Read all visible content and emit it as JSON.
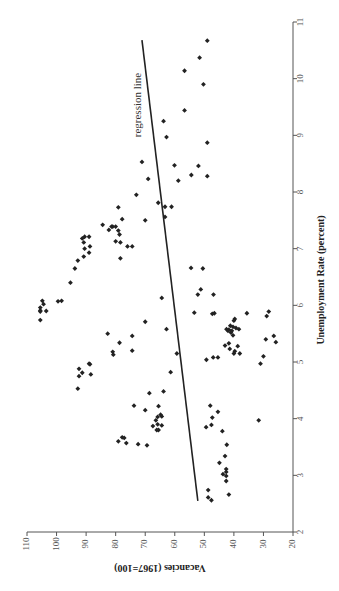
{
  "chart_data": {
    "type": "scatter",
    "orientation": "rotated-90-clockwise",
    "title": "",
    "xlabel": "Unemployment Rate (percent)",
    "ylabel": "Vacancies (1967=100)",
    "xlim": [
      2,
      11
    ],
    "ylim": [
      20,
      110
    ],
    "x_ticks": [
      2,
      3,
      4,
      5,
      6,
      7,
      8,
      9,
      10,
      11
    ],
    "y_ticks": [
      20,
      30,
      40,
      50,
      60,
      70,
      80,
      90,
      100,
      110
    ],
    "grid": false,
    "legend": null,
    "annotations": [
      {
        "text": "regression line",
        "x": 9.3,
        "y": 74
      }
    ],
    "regression_line": {
      "x": [
        2.55,
        10.68
      ],
      "y": [
        52.2,
        71.1
      ]
    },
    "series": [
      {
        "name": "observations",
        "points": [
          [
            10.67,
            49.0
          ],
          [
            10.37,
            51.6
          ],
          [
            10.14,
            56.7
          ],
          [
            9.9,
            50.3
          ],
          [
            9.44,
            56.7
          ],
          [
            8.87,
            49.0
          ],
          [
            8.46,
            52.0
          ],
          [
            8.3,
            54.4
          ],
          [
            8.28,
            49.0
          ],
          [
            9.25,
            63.8
          ],
          [
            8.97,
            62.8
          ],
          [
            8.47,
            60.1
          ],
          [
            8.2,
            58.8
          ],
          [
            8.53,
            71.1
          ],
          [
            8.23,
            69.0
          ],
          [
            7.95,
            73.0
          ],
          [
            7.73,
            79.1
          ],
          [
            7.52,
            77.8
          ],
          [
            7.81,
            65.6
          ],
          [
            7.74,
            63.3
          ],
          [
            7.74,
            61.1
          ],
          [
            7.56,
            63.3
          ],
          [
            7.5,
            70.0
          ],
          [
            7.39,
            80.0
          ],
          [
            7.39,
            81.0
          ],
          [
            7.39,
            81.4
          ],
          [
            7.32,
            79.1
          ],
          [
            7.25,
            78.7
          ],
          [
            7.04,
            74.4
          ],
          [
            6.83,
            78.4
          ],
          [
            7.42,
            84.4
          ],
          [
            7.33,
            82.3
          ],
          [
            7.13,
            80.0
          ],
          [
            7.11,
            78.4
          ],
          [
            7.04,
            76.0
          ],
          [
            7.21,
            90.5
          ],
          [
            7.21,
            89.0
          ],
          [
            7.18,
            91.3
          ],
          [
            7.11,
            90.8
          ],
          [
            7.04,
            88.7
          ],
          [
            7.0,
            90.5
          ],
          [
            6.93,
            89.0
          ],
          [
            6.86,
            90.8
          ],
          [
            6.79,
            92.8
          ],
          [
            6.65,
            93.8
          ],
          [
            6.4,
            95.3
          ],
          [
            6.07,
            99.5
          ],
          [
            6.08,
            98.3
          ],
          [
            6.08,
            104.8
          ],
          [
            6.02,
            104.4
          ],
          [
            5.96,
            105.5
          ],
          [
            5.91,
            105.5
          ],
          [
            5.9,
            103.5
          ],
          [
            5.89,
            105.5
          ],
          [
            5.74,
            105.5
          ],
          [
            6.66,
            54.5
          ],
          [
            6.65,
            50.5
          ],
          [
            6.13,
            64.4
          ],
          [
            6.28,
            51.2
          ],
          [
            6.19,
            52.2
          ],
          [
            6.19,
            46.9
          ],
          [
            5.86,
            46.6
          ],
          [
            5.85,
            47.3
          ],
          [
            5.87,
            53.4
          ],
          [
            5.58,
            62.8
          ],
          [
            5.89,
            28.2
          ],
          [
            5.81,
            28.9
          ],
          [
            5.86,
            35.6
          ],
          [
            5.76,
            39.7
          ],
          [
            5.73,
            40.0
          ],
          [
            5.64,
            41.2
          ],
          [
            5.58,
            42.5
          ],
          [
            5.62,
            40.3
          ],
          [
            5.6,
            39.3
          ],
          [
            5.57,
            41.7
          ],
          [
            5.55,
            40.7
          ],
          [
            5.58,
            38.3
          ],
          [
            5.55,
            42.0
          ],
          [
            5.52,
            41.0
          ],
          [
            5.47,
            40.3
          ],
          [
            5.29,
            43.0
          ],
          [
            5.33,
            41.7
          ],
          [
            5.28,
            38.7
          ],
          [
            5.23,
            41.4
          ],
          [
            5.19,
            39.7
          ],
          [
            5.15,
            40.0
          ],
          [
            5.15,
            38.0
          ],
          [
            5.08,
            45.4
          ],
          [
            5.08,
            47.0
          ],
          [
            5.04,
            49.3
          ],
          [
            5.4,
            29.2
          ],
          [
            5.46,
            26.5
          ],
          [
            5.35,
            25.8
          ],
          [
            5.1,
            30.0
          ],
          [
            4.97,
            31.0
          ],
          [
            5.15,
            59.3
          ],
          [
            4.82,
            61.4
          ],
          [
            4.48,
            63.8
          ],
          [
            5.71,
            70.0
          ],
          [
            5.5,
            82.7
          ],
          [
            5.46,
            74.4
          ],
          [
            5.34,
            78.7
          ],
          [
            5.18,
            81.0
          ],
          [
            5.13,
            80.8
          ],
          [
            5.2,
            74.4
          ],
          [
            4.97,
            89.0
          ],
          [
            4.96,
            88.7
          ],
          [
            4.88,
            92.4
          ],
          [
            4.81,
            91.3
          ],
          [
            4.78,
            88.4
          ],
          [
            4.75,
            92.4
          ],
          [
            4.53,
            92.8
          ],
          [
            4.45,
            68.6
          ],
          [
            4.23,
            73.8
          ],
          [
            4.22,
            65.5
          ],
          [
            4.15,
            70.0
          ],
          [
            4.03,
            65.8
          ],
          [
            4.07,
            64.8
          ],
          [
            4.04,
            64.4
          ],
          [
            3.97,
            66.4
          ],
          [
            3.9,
            65.8
          ],
          [
            3.88,
            64.4
          ],
          [
            3.87,
            67.4
          ],
          [
            3.8,
            66.1
          ],
          [
            3.8,
            65.5
          ],
          [
            3.67,
            77.8
          ],
          [
            3.66,
            77.1
          ],
          [
            3.6,
            79.1
          ],
          [
            3.57,
            76.4
          ],
          [
            3.55,
            72.4
          ],
          [
            3.53,
            69.4
          ],
          [
            3.97,
            31.6
          ],
          [
            3.78,
            43.9
          ],
          [
            4.23,
            48.0
          ],
          [
            4.12,
            45.4
          ],
          [
            4.02,
            47.3
          ],
          [
            3.89,
            47.6
          ],
          [
            3.85,
            49.4
          ],
          [
            3.54,
            42.4
          ],
          [
            3.34,
            43.0
          ],
          [
            3.22,
            44.9
          ],
          [
            3.11,
            42.6
          ],
          [
            3.06,
            42.6
          ],
          [
            3.02,
            43.7
          ],
          [
            2.99,
            42.6
          ],
          [
            2.9,
            42.6
          ],
          [
            2.66,
            41.7
          ],
          [
            2.61,
            48.7
          ],
          [
            2.74,
            48.7
          ],
          [
            2.56,
            47.6
          ]
        ]
      }
    ]
  },
  "labels": {
    "x_axis_title": "Unemployment Rate (percent)",
    "y_axis_title": "Vacancies (1967=100)",
    "regression_label": "regression line"
  }
}
